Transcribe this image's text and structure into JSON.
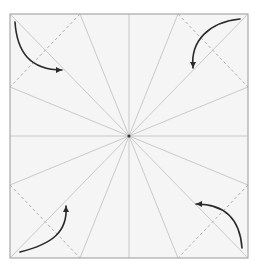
{
  "diagram": {
    "type": "origami-crease-pattern",
    "square": {
      "x": 10,
      "y": 14,
      "size": 238,
      "fill": "#f5f5f5",
      "stroke": "#a8a8a8"
    },
    "center": {
      "x": 129,
      "y": 136
    },
    "colors": {
      "crease": "#c4c4c4",
      "dashed_fold": "#b0b0b0",
      "arrow": "#2a2a2a",
      "center_dot": "#3a3a3a"
    },
    "radial_creases": [
      {
        "to": [
          129,
          14
        ]
      },
      {
        "to": [
          178,
          14
        ]
      },
      {
        "to": [
          248,
          14
        ]
      },
      {
        "to": [
          248,
          87
        ]
      },
      {
        "to": [
          248,
          136
        ]
      },
      {
        "to": [
          248,
          185
        ]
      },
      {
        "to": [
          248,
          252
        ]
      },
      {
        "to": [
          178,
          252
        ]
      },
      {
        "to": [
          129,
          252
        ]
      },
      {
        "to": [
          80,
          252
        ]
      },
      {
        "to": [
          10,
          252
        ]
      },
      {
        "to": [
          10,
          185
        ]
      },
      {
        "to": [
          10,
          136
        ]
      },
      {
        "to": [
          10,
          87
        ]
      },
      {
        "to": [
          10,
          14
        ]
      },
      {
        "to": [
          80,
          14
        ]
      }
    ],
    "dashed_folds": [
      {
        "name": "fold-top-left",
        "from": [
          80,
          14
        ],
        "to": [
          10,
          87
        ]
      },
      {
        "name": "fold-top-right",
        "from": [
          178,
          14
        ],
        "to": [
          248,
          87
        ]
      },
      {
        "name": "fold-bottom-left",
        "from": [
          10,
          185
        ],
        "to": [
          80,
          252
        ]
      },
      {
        "name": "fold-bottom-right",
        "from": [
          248,
          185
        ],
        "to": [
          178,
          252
        ]
      }
    ],
    "arrows": [
      {
        "name": "arrow-top-left",
        "path": "M15,22 C17,52 30,70 62,70",
        "head": [
          62,
          70
        ],
        "angle": 0
      },
      {
        "name": "arrow-top-right",
        "path": "M240,19 C210,22 190,40 193,68",
        "head": [
          193,
          68
        ],
        "angle": 90
      },
      {
        "name": "arrow-bottom-left",
        "path": "M20,252 C52,244 68,232 66,206",
        "head": [
          66,
          206
        ],
        "angle": -90
      },
      {
        "name": "arrow-bottom-right",
        "path": "M242,248 C240,220 226,204 196,204",
        "head": [
          196,
          204
        ],
        "angle": 180
      }
    ]
  }
}
